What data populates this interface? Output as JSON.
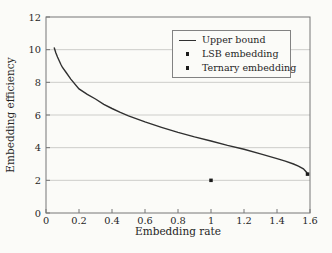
{
  "figure": {
    "background": "#fbfbf8",
    "text_color": "#262626"
  },
  "chart_data": {
    "type": "line",
    "title": "",
    "xlabel": "Embedding rate",
    "ylabel": "Embedding efficiency",
    "xlim": [
      0,
      1.6
    ],
    "ylim": [
      0,
      12
    ],
    "xticks": [
      0,
      0.2,
      0.4,
      0.6,
      0.8,
      1,
      1.2,
      1.4,
      1.6
    ],
    "xtick_labels": [
      "0",
      "0.2",
      "0.4",
      "0.6",
      "0.8",
      "1",
      "1.2",
      "1.4",
      "1.6"
    ],
    "yticks": [
      0,
      2,
      4,
      6,
      8,
      10,
      12
    ],
    "ytick_labels": [
      "0",
      "2",
      "4",
      "6",
      "8",
      "10",
      "12"
    ],
    "grid": "horizontal-only",
    "grid_lines_y": [
      2,
      4,
      6,
      8,
      10
    ],
    "colors": {
      "grid": "#cdcdca",
      "spine": "#767676",
      "curve": "#303030",
      "marker": "#1c1c1c"
    },
    "legend": {
      "position": "upper-right",
      "entries": [
        {
          "label": "Upper bound",
          "symbol": "line"
        },
        {
          "label": "LSB embedding",
          "symbol": "dot"
        },
        {
          "label": "Ternary embedding",
          "symbol": "dot"
        }
      ]
    },
    "series": [
      {
        "name": "Upper bound",
        "type": "line",
        "color": "#303030",
        "x": [
          0.05,
          0.06,
          0.07,
          0.08,
          0.09,
          0.1,
          0.12,
          0.15,
          0.2,
          0.25,
          0.3,
          0.35,
          0.4,
          0.45,
          0.5,
          0.6,
          0.7,
          0.8,
          0.9,
          1.0,
          1.1,
          1.2,
          1.3,
          1.4,
          1.45,
          1.5,
          1.53,
          1.56,
          1.58,
          1.585
        ],
        "y": [
          10.1,
          9.8,
          9.55,
          9.32,
          9.11,
          8.91,
          8.63,
          8.2,
          7.6,
          7.27,
          6.98,
          6.65,
          6.4,
          6.16,
          5.95,
          5.58,
          5.25,
          4.94,
          4.66,
          4.41,
          4.14,
          3.9,
          3.62,
          3.33,
          3.18,
          3.0,
          2.87,
          2.7,
          2.48,
          2.38
        ]
      },
      {
        "name": "LSB embedding",
        "type": "scatter",
        "marker": "square",
        "color": "#1c1c1c",
        "x": [
          1.0
        ],
        "y": [
          2.0
        ]
      },
      {
        "name": "Ternary embedding",
        "type": "scatter",
        "marker": "square",
        "color": "#1c1c1c",
        "x": [
          1.585
        ],
        "y": [
          2.38
        ]
      }
    ]
  }
}
